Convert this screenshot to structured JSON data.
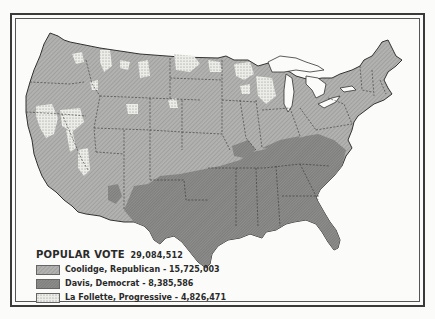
{
  "map": {
    "subject": "1924 United States presidential election popular vote by county",
    "legend": {
      "title": "POPULAR VOTE",
      "total": "29,084,512",
      "entries": [
        {
          "label": "Coolidge, Republican - 15,725,003",
          "candidate": "Coolidge",
          "party": "Republican",
          "votes": "15,725,003",
          "color": "#a9a9a9",
          "pattern": "fine-hatch"
        },
        {
          "label": "Davis, Democrat - 8,385,586",
          "candidate": "Davis",
          "party": "Democrat",
          "votes": "8,385,586",
          "color": "#8a8a8a",
          "pattern": "dense-hatch"
        },
        {
          "label": "La Follette, Progressive - 4,826,471",
          "candidate": "La Follette",
          "party": "Progressive",
          "votes": "4,826,471",
          "color": "#e4e4e0",
          "pattern": "stipple"
        }
      ]
    },
    "colors": {
      "background": "#fbfbf9",
      "frame": "#3a3a3a",
      "water": "#fbfbf9",
      "republican": "#a9a9a9",
      "democrat": "#8a8a8a",
      "progressive": "#e4e4e0"
    }
  }
}
